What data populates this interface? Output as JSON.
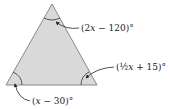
{
  "figure": {
    "shape": "triangle",
    "fill_color": "#d9d9d9",
    "stroke_color": "#8a8a8a",
    "angles": {
      "top": {
        "label": "(2x − 120)°",
        "open": "(2",
        "var": "x",
        "rest": " − 120)°"
      },
      "bottom_right": {
        "label": "(½x + 15)°",
        "open": "(",
        "frac": "½",
        "var": "x",
        "rest": " + 15)°"
      },
      "bottom_left": {
        "label": "(x − 30)°",
        "open": "(",
        "var": "x",
        "rest": " − 30)°"
      }
    }
  }
}
